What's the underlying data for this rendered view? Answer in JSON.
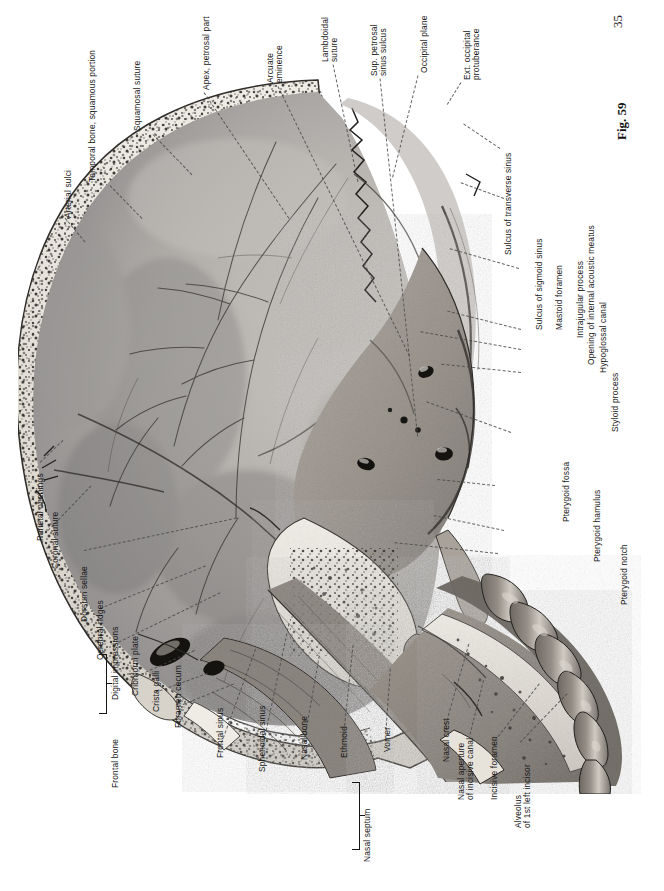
{
  "page": {
    "folio": "35",
    "figure_number": "Fig. 59",
    "background": "#ffffff",
    "ink": "#151515"
  },
  "figure": {
    "caption_id": "Fig. 59",
    "orientation": "plate rotated 90 degrees; all labels read bottom-to-top"
  },
  "labels": {
    "top_left_group": [
      {
        "id": "arterial-sulci",
        "text": "Arterial sulci"
      },
      {
        "id": "temporal-bone-squamous-portion",
        "text": "Temporal bone, squamous portion"
      },
      {
        "id": "squamosal-suture",
        "text": "Squamosal suture"
      },
      {
        "id": "apex-petrosal-part",
        "text": "Apex, petrosal part"
      }
    ],
    "top_right_group": [
      {
        "id": "arcuate-eminence",
        "line1": "Arcuate",
        "line2": "eminence"
      },
      {
        "id": "lambdoidal-suture",
        "line1": "Lambdoidal",
        "line2": "suture"
      },
      {
        "id": "sup-petrosal-sinus-sulcus",
        "line1": "Sup. petrosal",
        "line2": "sinus sulcus"
      },
      {
        "id": "occipital-plane",
        "text": "Occipital plane"
      },
      {
        "id": "ext-occipital-protuberance",
        "line1": "Ext. occipital",
        "line2": "protuberance"
      },
      {
        "id": "sulcus-of-transverse-sinus",
        "text": "Sulcus of transverse sinus"
      }
    ],
    "right_group": [
      {
        "id": "sulcus-of-sigmoid-sinus",
        "text": "Sulcus of sigmoid sinus"
      },
      {
        "id": "mastoid-foramen",
        "text": "Mastoid foramen"
      },
      {
        "id": "intrajugular-process",
        "text": "Intrajugular process"
      },
      {
        "id": "opening-of-internal-acoustic-meatus",
        "text": "Opening of internal acoustic meatus"
      },
      {
        "id": "hypoglossal-canal",
        "text": "Hypoglossal canal"
      },
      {
        "id": "styloid-process",
        "text": "Styloid process"
      },
      {
        "id": "pterygoid-fossa",
        "text": "Pterygoid fossa"
      },
      {
        "id": "pterygoid-hamulus",
        "text": "Pterygoid hamulus"
      },
      {
        "id": "pterygoid-notch",
        "text": "Pterygoid notch"
      }
    ],
    "left_group": [
      {
        "id": "parietal-openings",
        "text": "Parietal openings"
      },
      {
        "id": "coronal-suture",
        "text": "Coronal suture"
      },
      {
        "id": "dorsum-sellae",
        "text": "Dorsum sellae"
      },
      {
        "id": "cerebral-ridges",
        "text": "Cerebral ridges"
      },
      {
        "id": "digital-impressions",
        "text": "Digital impressions"
      },
      {
        "id": "cribriform-plate",
        "text": "Cribriform plate"
      },
      {
        "id": "crista-galli",
        "text": "Crista galli"
      },
      {
        "id": "foramen-cecum",
        "text": "Foramen cecum"
      },
      {
        "id": "frontal-bone",
        "text": "Frontal bone"
      }
    ],
    "bottom_group": [
      {
        "id": "frontal-sinus",
        "text": "Frontal sinus"
      },
      {
        "id": "sphenoidal-sinus",
        "text": "Sphenoidal sinus"
      },
      {
        "id": "nasal-bone",
        "text": "Nasal bone"
      },
      {
        "id": "ethmoid",
        "text": "Ethmoid"
      },
      {
        "id": "vomer",
        "text": "Vomer"
      },
      {
        "id": "nasal-septum",
        "text": "Nasal septum"
      },
      {
        "id": "nasal-crest",
        "text": "Nasal crest"
      },
      {
        "id": "nasal-aperture-of-incisive-canal",
        "line1": "Nasal aperture",
        "line2": "of incisive canal"
      },
      {
        "id": "incisive-foramen",
        "text": "Incisive foramen"
      },
      {
        "id": "alveolus-of-1st-left-incisor",
        "line1": "Alveolus",
        "line2": "of 1st left incisor"
      }
    ],
    "brackets": [
      {
        "id": "frontal-bone-bracket",
        "groups": [
          "Cerebral ridges",
          "Digital impressions"
        ],
        "label": "Frontal bone"
      },
      {
        "id": "nasal-septum-bracket",
        "groups": [
          "Ethmoid",
          "Vomer"
        ],
        "label": "Nasal septum"
      }
    ]
  }
}
